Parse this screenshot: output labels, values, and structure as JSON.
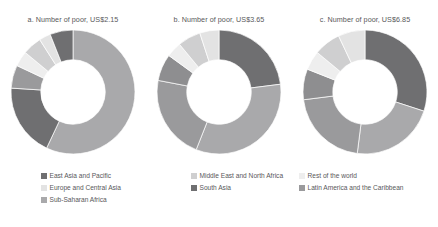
{
  "figure": {
    "background": "#ffffff",
    "text_color": "#58585a"
  },
  "legend": {
    "position": "bottom",
    "columns": 3,
    "items": [
      {
        "label": "East Asia and Pacific",
        "color": "#6f6f71"
      },
      {
        "label": "Europe and Central Asia",
        "color": "#e3e3e3"
      },
      {
        "label": "Latin America and the Caribbean",
        "color": "#9a9a9c"
      },
      {
        "label": "Middle East and North Africa",
        "color": "#cfcfd0"
      },
      {
        "label": "South Asia",
        "color": "#6f6f71"
      },
      {
        "label": "Sub-Saharan Africa",
        "color": "#a9a9ab"
      },
      {
        "label": "Rest of the world",
        "color": "#eeeeee"
      }
    ],
    "order": [
      "East Asia and Pacific",
      "Middle East and North Africa",
      "Rest of the world",
      "Europe and Central Asia",
      "South Asia",
      "Latin America and the Caribbean",
      "Sub-Saharan Africa"
    ]
  },
  "charts": [
    {
      "id": "chart-a",
      "title": "a. Number of poor, US$2.15"
    },
    {
      "id": "chart-b",
      "title": "b. Number of poor, US$3.65"
    },
    {
      "id": "chart-c",
      "title": "c. Number of poor, US$6.85"
    }
  ],
  "chart_data": [
    {
      "type": "pie",
      "variant": "donut",
      "title": "a. Number of poor, US$2.15",
      "poverty_line": "US$2.15",
      "unit": "share of total number of poor (%)",
      "hole_ratio": 0.52,
      "start_angle_deg": 0,
      "direction": "clockwise",
      "categories": [
        "Sub-Saharan Africa",
        "South Asia",
        "Latin America and the Caribbean",
        "Rest of the world",
        "Middle East and North Africa",
        "Europe and Central Asia",
        "East Asia and Pacific"
      ],
      "values": [
        57,
        19,
        6,
        4,
        5,
        3,
        6
      ],
      "colors": [
        "#a9a9ab",
        "#6f6f71",
        "#9a9a9c",
        "#eeeeee",
        "#cfcfd0",
        "#e3e3e3",
        "#6f6f71"
      ]
    },
    {
      "type": "pie",
      "variant": "donut",
      "title": "b. Number of poor, US$3.65",
      "poverty_line": "US$3.65",
      "unit": "share of total number of poor (%)",
      "hole_ratio": 0.52,
      "start_angle_deg": 0,
      "direction": "clockwise",
      "categories": [
        "East Asia and Pacific",
        "Sub-Saharan Africa",
        "South Asia",
        "Latin America and the Caribbean",
        "Rest of the world",
        "Middle East and North Africa",
        "Europe and Central Asia"
      ],
      "values": [
        23,
        33,
        22,
        7,
        4,
        6,
        5
      ],
      "colors": [
        "#6f6f71",
        "#a9a9ab",
        "#9a9a9c",
        "#8e8e90",
        "#eeeeee",
        "#cfcfd0",
        "#e3e3e3"
      ]
    },
    {
      "type": "pie",
      "variant": "donut",
      "title": "c. Number of poor, US$6.85",
      "poverty_line": "US$6.85",
      "unit": "share of total number of poor (%)",
      "hole_ratio": 0.52,
      "start_angle_deg": 0,
      "direction": "clockwise",
      "categories": [
        "East Asia and Pacific",
        "Sub-Saharan Africa",
        "South Asia",
        "Latin America and the Caribbean",
        "Rest of the world",
        "Middle East and North Africa",
        "Europe and Central Asia"
      ],
      "values": [
        30,
        22,
        21,
        8,
        5,
        7,
        7
      ],
      "colors": [
        "#6f6f71",
        "#a9a9ab",
        "#9a9a9c",
        "#8e8e90",
        "#eeeeee",
        "#cfcfd0",
        "#e3e3e3"
      ]
    }
  ]
}
